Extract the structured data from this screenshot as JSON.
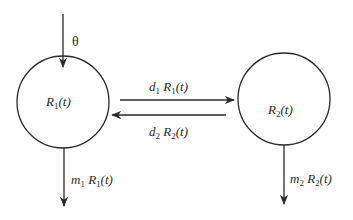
{
  "diagram": {
    "type": "compartment-model",
    "nodes": [
      {
        "id": "R1",
        "label": {
          "base": "R",
          "sub": "1",
          "tail": "(t)"
        }
      },
      {
        "id": "R2",
        "label": {
          "base": "R",
          "sub": "2",
          "tail": "(t)"
        }
      }
    ],
    "edges": [
      {
        "from": "source",
        "to": "R1",
        "label": "θ"
      },
      {
        "from": "R1",
        "to": "R2",
        "label": {
          "coef": "d",
          "coef_sub": "1",
          "base": "R",
          "sub": "1",
          "tail": "(t)"
        }
      },
      {
        "from": "R2",
        "to": "R1",
        "label": {
          "coef": "d",
          "coef_sub": "2",
          "base": "R",
          "sub": "2",
          "tail": "(t)"
        }
      },
      {
        "from": "R1",
        "to": "sink",
        "label": {
          "coef": "m",
          "coef_sub": "1",
          "base": "R",
          "sub": "1",
          "tail": "(t)"
        }
      },
      {
        "from": "R2",
        "to": "sink",
        "label": {
          "coef": "m",
          "coef_sub": "2",
          "base": "R",
          "sub": "2",
          "tail": "(t)"
        }
      }
    ],
    "colors": {
      "stroke": "#2a2a2a",
      "background": "#ffffff"
    }
  }
}
